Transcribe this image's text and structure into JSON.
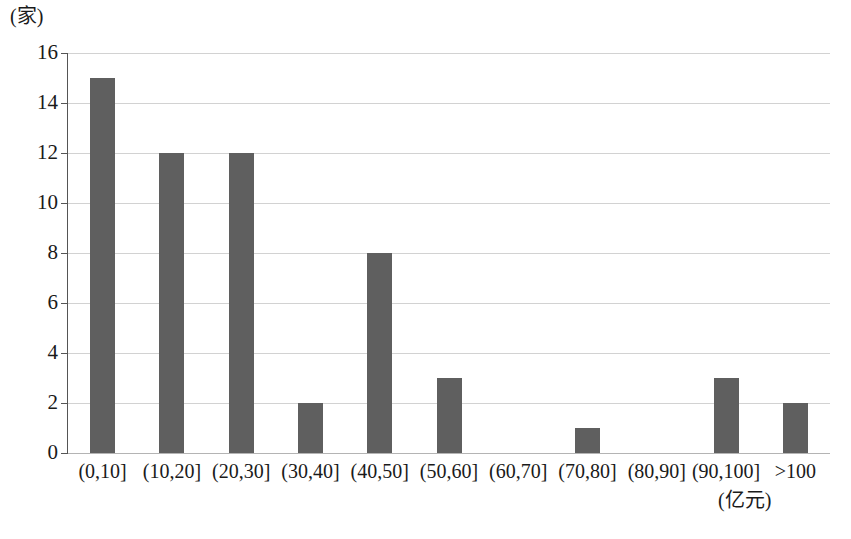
{
  "chart_data": {
    "type": "bar",
    "title": "",
    "subtitle": "",
    "xlabel": "(亿元)",
    "ylabel": "(家)",
    "categories": [
      "(0,10]",
      "(10,20]",
      "(20,30]",
      "(30,40]",
      "(40,50]",
      "(50,60]",
      "(60,70]",
      "(70,80]",
      "(80,90]",
      "(90,100]",
      ">100"
    ],
    "values": [
      15,
      12,
      12,
      2,
      8,
      3,
      0,
      1,
      0,
      3,
      2
    ],
    "ylim": [
      0,
      16
    ],
    "ytick_step": 2,
    "ytick_labels": [
      "0",
      "2",
      "4",
      "6",
      "8",
      "10",
      "12",
      "14",
      "16"
    ],
    "grid": true,
    "grid_axis": "y",
    "legend": false,
    "legend_position": "none",
    "bar_color": "#5f5f5f",
    "gridline_color": "#d2d2d2",
    "axis_color": "#555555",
    "background_color": "#ffffff"
  }
}
